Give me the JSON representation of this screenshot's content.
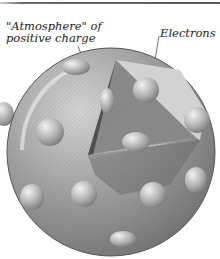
{
  "diagram": {
    "labels": {
      "atmosphere_line1": "\"Atmosphere\" of",
      "atmosphere_line2": "positive charge",
      "electrons": "Electrons"
    },
    "colors": {
      "sphere": "#9a9a9a",
      "sphere_light": "#d8d8d8",
      "cutaway_dark": "#5a5a5a",
      "cutaway_light": "#cfcfcf",
      "electron": "#b5b5b5",
      "rule": "#5a5a5a"
    }
  }
}
